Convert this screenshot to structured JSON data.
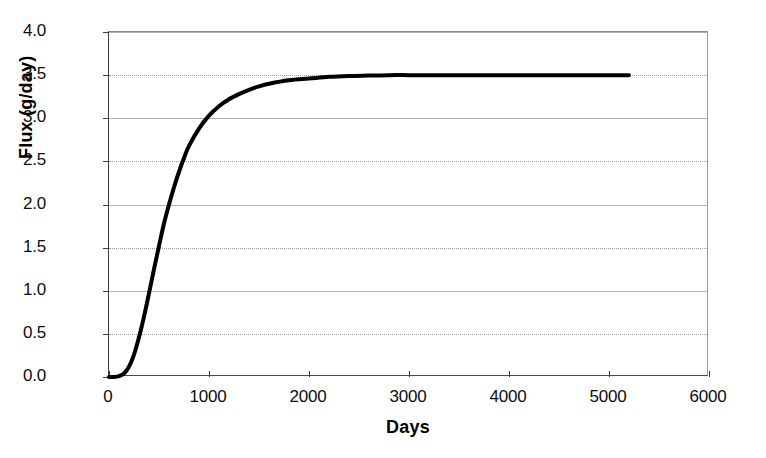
{
  "chart_data": {
    "type": "line",
    "title": "",
    "xlabel": "Days",
    "ylabel": "Flux (g/day)",
    "xlim": [
      0,
      6000
    ],
    "ylim": [
      0.0,
      4.0
    ],
    "xticks": [
      0,
      1000,
      2000,
      3000,
      4000,
      5000,
      6000
    ],
    "xtick_labels": [
      "0",
      "1000",
      "2000",
      "3000",
      "4000",
      "5000",
      "6000"
    ],
    "yticks": [
      0.0,
      0.5,
      1.0,
      1.5,
      2.0,
      2.5,
      3.0,
      3.5,
      4.0
    ],
    "ytick_labels": [
      "0.0",
      "0.5",
      "1.0",
      "1.5",
      "2.0",
      "2.5",
      "3.0",
      "3.5",
      "4.0"
    ],
    "grid": true,
    "grid_axis": "y",
    "legend": null,
    "legend_position": "none",
    "line_color": "#000000",
    "line_width_px": 4,
    "series": [
      {
        "name": "Flux",
        "x": [
          0,
          50,
          100,
          150,
          200,
          250,
          300,
          350,
          400,
          450,
          500,
          550,
          600,
          650,
          700,
          750,
          800,
          900,
          1000,
          1100,
          1200,
          1300,
          1400,
          1500,
          1600,
          1800,
          2000,
          2200,
          2400,
          2600,
          2800,
          3000,
          3200,
          3400,
          3600,
          4000,
          4400,
          4800,
          5200
        ],
        "y": [
          0.0,
          0.0,
          0.01,
          0.04,
          0.12,
          0.26,
          0.46,
          0.7,
          0.97,
          1.25,
          1.52,
          1.78,
          2.0,
          2.2,
          2.38,
          2.54,
          2.68,
          2.88,
          3.03,
          3.14,
          3.22,
          3.28,
          3.33,
          3.37,
          3.4,
          3.44,
          3.46,
          3.48,
          3.49,
          3.495,
          3.5,
          3.5,
          3.5,
          3.5,
          3.5,
          3.5,
          3.5,
          3.5,
          3.5
        ]
      }
    ],
    "notes": {
      "plateau_value": 3.5,
      "data_end_x": 5200,
      "curve_shape": "sigmoidal breakthrough curve rising from 0 and asymptoting at 3.5 g/day"
    }
  }
}
